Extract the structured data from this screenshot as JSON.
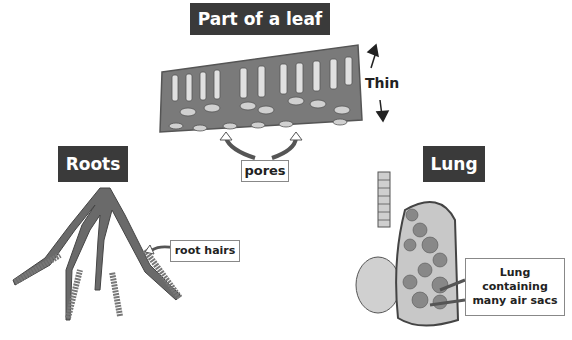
{
  "titles": {
    "leaf": "Part of a leaf",
    "roots": "Roots",
    "lung": "Lung"
  },
  "labels": {
    "pores": "pores",
    "root_hairs": "root hairs",
    "thin": "Thin",
    "lung_line1": "Lung",
    "lung_line2": "containing",
    "lung_line3": "many air sacs"
  },
  "colors": {
    "title_bg": "#3a3a3a",
    "tissue": "#7a7a7a",
    "cell_light": "#d8d8d8",
    "lung_fill": "#c8c8c8"
  }
}
